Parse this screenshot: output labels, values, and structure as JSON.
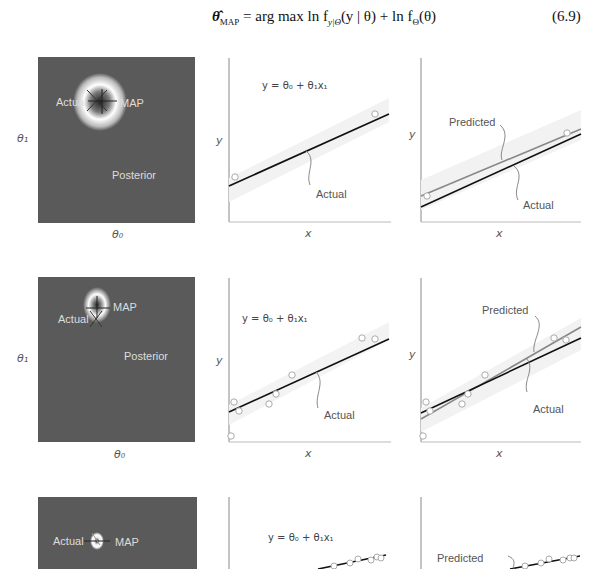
{
  "equation": {
    "lhs": "θ̂",
    "lhs_sub": "MAP",
    "rhs": " = arg max ln f",
    "rhs_sub1": "y|Θ",
    "rhs_part2": "(y | θ) + ln f",
    "rhs_sub2": "Θ",
    "rhs_part3": "(θ)",
    "argmax_under": "θ",
    "number": "(6.9)"
  },
  "rows": [
    {
      "posterior": {
        "label_actual": "Actual",
        "label_map": "MAP",
        "label_posterior": "Posterior",
        "x_label": "θ₀",
        "y_label": "θ₁"
      },
      "model_plot": {
        "formula": "y = θ₀ + θ₁x₁",
        "actual_label": "Actual",
        "x_label": "x",
        "y_label": "y"
      },
      "prediction_plot": {
        "predicted_label": "Predicted",
        "actual_label": "Actual",
        "x_label": "x",
        "y_label": "y"
      }
    },
    {
      "posterior": {
        "label_actual": "Actual",
        "label_map": "MAP",
        "label_posterior": "Posterior",
        "x_label": "θ₀",
        "y_label": "θ₁"
      },
      "model_plot": {
        "formula": "y = θ₀ + θ₁x₁",
        "actual_label": "Actual",
        "x_label": "x",
        "y_label": "y"
      },
      "prediction_plot": {
        "predicted_label": "Predicted",
        "actual_label": "Actual",
        "x_label": "x",
        "y_label": "y"
      }
    },
    {
      "posterior": {
        "label_actual": "Actual",
        "label_map": "MAP"
      },
      "model_plot": {
        "formula": "y = θ₀ + θ₁x₁"
      },
      "prediction_plot": {
        "predicted_label": "Predicted"
      }
    }
  ],
  "colors": {
    "posterior_bg": "#5a5a5a",
    "actual_line": "#111111",
    "predicted_line": "#8a8a8a",
    "band": "#ececec"
  }
}
